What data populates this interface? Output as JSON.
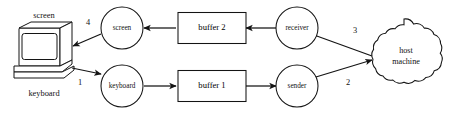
{
  "diagram": {
    "background_color": "#ffffff",
    "line_color": "#141414",
    "terminal": {
      "screen_label": "screen",
      "keyboard_label": "keyboard"
    },
    "nodes": {
      "screen_circle": "screen",
      "keyboard_circle": "keyboard",
      "buffer_two": "buffer 2",
      "buffer_one": "buffer 1",
      "receiver": "receiver",
      "sender": "sender",
      "host_line1": "host",
      "host_line2": "machine"
    },
    "steps": {
      "step_one": "1",
      "step_two": "2",
      "step_three": "3",
      "step_four": "4"
    }
  }
}
